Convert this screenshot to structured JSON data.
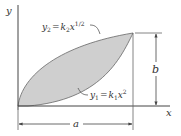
{
  "diagram": {
    "axes": {
      "x_label": "x",
      "y_label": "y"
    },
    "curves": {
      "upper": {
        "lhs": "y",
        "lhs_sub": "2",
        "eq": "=",
        "k": "k",
        "k_sub": "2",
        "var": "x",
        "exp": "1/2"
      },
      "lower": {
        "lhs": "y",
        "lhs_sub": "1",
        "eq": "=",
        "k": "k",
        "k_sub": "1",
        "var": "x",
        "exp": "2"
      }
    },
    "dimensions": {
      "width_label": "a",
      "height_label": "b"
    },
    "colors": {
      "fill": "#cfcfcf",
      "line": "#444444",
      "text": "#333333"
    }
  }
}
